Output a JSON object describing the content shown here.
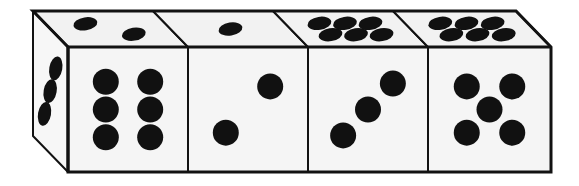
{
  "scene": {
    "title": "Row of four dice in oblique projection",
    "background_color": "#ffffff",
    "face_color": "#f5f5f5",
    "top_face_color": "#f2f2f2",
    "left_face_color": "#f7f7f7",
    "outline_color": "#121212",
    "pip_color": "#111111",
    "outline_width": 3,
    "inner_line_width": 2,
    "width": 579,
    "height": 186
  },
  "projection": {
    "front_left_x": 68,
    "front_top_y": 47,
    "front_bottom_y": 172,
    "right_x": 551,
    "skew_dx": -35,
    "skew_dy": -36,
    "die_front_width": 120,
    "pip_radius_front": 13,
    "pip_radius_top_rx": 12,
    "pip_radius_top_ry": 6.5,
    "pip_radius_left_rx": 6.5,
    "pip_radius_left_ry": 12
  },
  "dice": [
    {
      "index": 1,
      "name": "die-1",
      "front_face_value": 6,
      "top_face_value": 2,
      "left_face_value": 3,
      "front_x_start": 68,
      "front_x_end": 188
    },
    {
      "index": 2,
      "name": "die-2",
      "front_face_value": 2,
      "top_face_value": 1,
      "left_face_value": null,
      "front_x_start": 188,
      "front_x_end": 308
    },
    {
      "index": 3,
      "name": "die-3",
      "front_face_value": 3,
      "top_face_value": 6,
      "left_face_value": null,
      "front_x_start": 308,
      "front_x_end": 428
    },
    {
      "index": 4,
      "name": "die-4",
      "front_face_value": 5,
      "top_face_value": 6,
      "left_face_value": null,
      "front_x_start": 428,
      "front_x_end": 551
    }
  ],
  "pip_layouts": {
    "1": [
      [
        0.5,
        0.5
      ]
    ],
    "2": [
      [
        0.25,
        0.75
      ],
      [
        0.75,
        0.25
      ]
    ],
    "3": [
      [
        0.22,
        0.78
      ],
      [
        0.5,
        0.5
      ],
      [
        0.78,
        0.22
      ]
    ],
    "5": [
      [
        0.25,
        0.25
      ],
      [
        0.75,
        0.25
      ],
      [
        0.5,
        0.5
      ],
      [
        0.25,
        0.75
      ],
      [
        0.75,
        0.75
      ]
    ],
    "6": [
      [
        0.25,
        0.2
      ],
      [
        0.75,
        0.2
      ],
      [
        0.25,
        0.5
      ],
      [
        0.75,
        0.5
      ],
      [
        0.25,
        0.8
      ],
      [
        0.75,
        0.8
      ]
    ]
  },
  "pip_layouts_top": {
    "1": [
      [
        0.5,
        0.5
      ]
    ],
    "2": [
      [
        0.28,
        0.7
      ],
      [
        0.7,
        0.3
      ]
    ],
    "6": [
      [
        0.22,
        0.28
      ],
      [
        0.5,
        0.28
      ],
      [
        0.78,
        0.28
      ],
      [
        0.22,
        0.72
      ],
      [
        0.5,
        0.72
      ],
      [
        0.78,
        0.72
      ]
    ]
  },
  "pip_layouts_left": {
    "3": [
      [
        0.24,
        0.2
      ],
      [
        0.5,
        0.5
      ],
      [
        0.76,
        0.8
      ]
    ]
  },
  "totals": {
    "dice_count": 4,
    "front_values_sum": 16,
    "top_values_sum": 15
  }
}
